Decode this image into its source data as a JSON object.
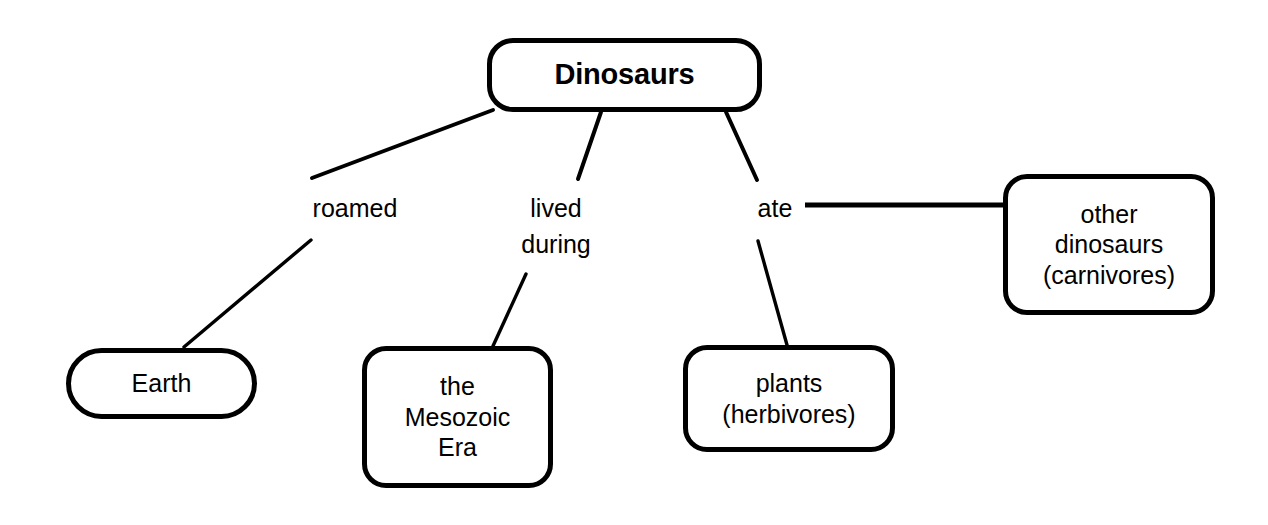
{
  "diagram": {
    "type": "concept-map",
    "title": "Dinosaurs",
    "background_color": "#ffffff",
    "stroke_color": "#000000",
    "nodes": [
      {
        "id": "root",
        "text": "Dinosaurs",
        "shape": "rounded-rect",
        "bold": true
      },
      {
        "id": "earth",
        "text": "Earth",
        "shape": "pill",
        "bold": false
      },
      {
        "id": "mesozoic",
        "text": "the\nMesozoic\nEra",
        "shape": "rounded-rect",
        "bold": false
      },
      {
        "id": "plants",
        "text": "plants\n(herbivores)",
        "shape": "rounded-rect",
        "bold": false
      },
      {
        "id": "carnivores",
        "text": "other\ndinosaurs\n(carnivores)",
        "shape": "rounded-rect",
        "bold": false
      }
    ],
    "edge_labels": [
      {
        "id": "roamed",
        "text": "roamed",
        "from": "root",
        "to": "earth"
      },
      {
        "id": "lived-during",
        "text": "lived\nduring",
        "from": "root",
        "to": "mesozoic"
      },
      {
        "id": "ate",
        "text": "ate",
        "from": "root",
        "to": "plants"
      }
    ]
  }
}
